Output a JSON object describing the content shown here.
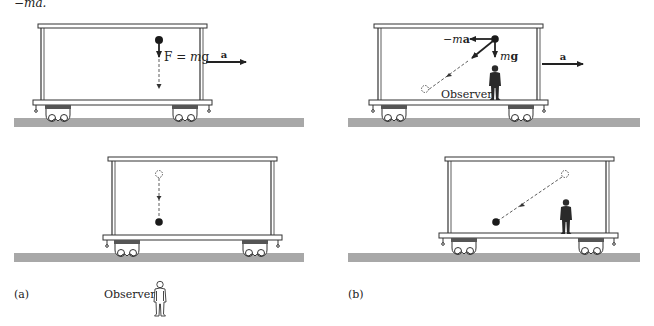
{
  "header": {
    "fragment_text": "−ma."
  },
  "colors": {
    "ground": "#a8a8a8",
    "ground_edge": "#8c8c8c",
    "line": "#333333",
    "ball": "#1a1a1a",
    "figure": "#2a2a2a"
  },
  "panel_a": {
    "caption": "(a)",
    "top_scene": {
      "force_label": "F = mg",
      "force_label_parts": {
        "F": "F",
        "eq": " = ",
        "m": "m",
        "g": "g"
      },
      "accel_label": "a"
    },
    "bottom_scene": {
      "observer_label": "Observer"
    }
  },
  "panel_b": {
    "caption": "(b)",
    "top_scene": {
      "pseudo_force_label": "−ma",
      "pseudo_force_parts": {
        "minus": "−",
        "m": "m",
        "a": "a"
      },
      "gravity_label": "mg",
      "gravity_parts": {
        "m": "m",
        "g": "g"
      },
      "observer_label": "Observer",
      "accel_label": "a"
    },
    "bottom_scene": {}
  }
}
